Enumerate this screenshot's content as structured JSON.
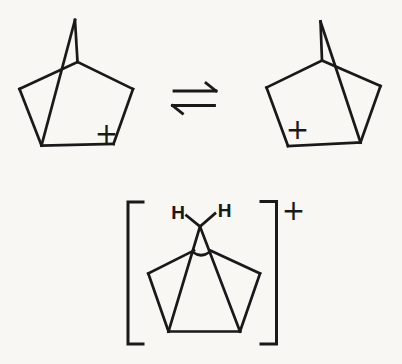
{
  "page": {
    "background_color": "#f8f7f4",
    "ink_color": "#191919"
  },
  "diagram": {
    "kind": "chemical-structure-scheme",
    "labels": {
      "left_structure_charge": {
        "text": "+",
        "x": 106.5,
        "y": 143
      },
      "right_structure_charge": {
        "text": "+",
        "x": 297.5,
        "y": 139
      },
      "bridged_charge": {
        "text": "+",
        "x": 293.5,
        "y": 220
      },
      "h_left": {
        "text": "H",
        "x": 178,
        "y": 219
      },
      "h_right": {
        "text": "H",
        "x": 224.5,
        "y": 216.5
      }
    },
    "drawing": {
      "stroke": "#191919",
      "stroke_width": 2.7,
      "groups": [
        {
          "name": "left-classical-cation-skeleton",
          "item_name": "bond-line",
          "segments": [
            [
              [
                75,
                20
              ],
              [
                77.5,
                62
              ]
            ],
            [
              [
                75,
                20
              ],
              [
                41.5,
                145.5
              ]
            ],
            [
              [
                77.5,
                62
              ],
              [
                19.5,
                89
              ]
            ],
            [
              [
                77.5,
                62
              ],
              [
                133,
                89
              ]
            ],
            [
              [
                19.5,
                89
              ],
              [
                41.5,
                145.5
              ]
            ],
            [
              [
                133,
                89
              ],
              [
                113.5,
                144
              ]
            ],
            [
              [
                41.5,
                145.5
              ],
              [
                113.5,
                144
              ]
            ]
          ]
        },
        {
          "name": "equilibrium-arrow",
          "item_name": "harpoon-line",
          "stroke_width": 2.8,
          "segments": [
            [
              [
                174,
                91
              ],
              [
                216,
                91
              ]
            ],
            [
              [
                216,
                91
              ],
              [
                206,
                83
              ]
            ],
            [
              [
                172.5,
                105.5
              ],
              [
                214.5,
                105.5
              ]
            ],
            [
              [
                172.5,
                105.5
              ],
              [
                182.5,
                113.5
              ]
            ]
          ]
        },
        {
          "name": "right-classical-cation-skeleton",
          "item_name": "bond-line",
          "segments": [
            [
              [
                320.5,
                21.5
              ],
              [
                322,
                60.5
              ]
            ],
            [
              [
                320.5,
                21.5
              ],
              [
                360.5,
                142.5
              ]
            ],
            [
              [
                322,
                60.5
              ],
              [
                266.5,
                87.5
              ]
            ],
            [
              [
                322,
                60.5
              ],
              [
                380.5,
                86
              ]
            ],
            [
              [
                266.5,
                87.5
              ],
              [
                288,
                146
              ]
            ],
            [
              [
                380.5,
                86
              ],
              [
                360.5,
                142.5
              ]
            ],
            [
              [
                288,
                146
              ],
              [
                360.5,
                142.5
              ]
            ]
          ]
        },
        {
          "name": "bridged-nonclassical-cation-skeleton",
          "item_name": "bond-line",
          "segments": [
            [
              [
                186.5,
                215.5
              ],
              [
                200,
                226.5
              ]
            ],
            [
              [
                200,
                226.5
              ],
              [
                215,
                213.5
              ]
            ],
            [
              [
                200,
                226.5
              ],
              [
                168.5,
                331.5
              ]
            ],
            [
              [
                200,
                226.5
              ],
              [
                240,
                331.5
              ]
            ],
            [
              [
                148.3,
                273.5
              ],
              [
                194,
                250.5
              ]
            ],
            [
              [
                260,
                273.5
              ],
              [
                210.5,
                250.5
              ]
            ],
            [
              [
                148.3,
                273.5
              ],
              [
                168.5,
                331.5
              ]
            ],
            [
              [
                260,
                273.5
              ],
              [
                240,
                331.5
              ]
            ],
            [
              [
                168.5,
                331.5
              ],
              [
                240,
                331.5
              ]
            ]
          ],
          "paths": [
            "M 192.6 252 Q 201.2 258.5 209.6 252"
          ]
        },
        {
          "name": "left-bracket",
          "item_name": "bracket-stroke",
          "stroke_width": 3,
          "polylines": [
            [
              [
                143,
                202
              ],
              [
                128,
                202
              ],
              [
                128,
                344
              ],
              [
                143,
                344
              ]
            ]
          ]
        },
        {
          "name": "right-bracket",
          "item_name": "bracket-stroke",
          "stroke_width": 3,
          "polylines": [
            [
              [
                261,
                201.5
              ],
              [
                276.5,
                201.5
              ],
              [
                276.5,
                344
              ],
              [
                261,
                344
              ]
            ]
          ]
        }
      ]
    }
  }
}
